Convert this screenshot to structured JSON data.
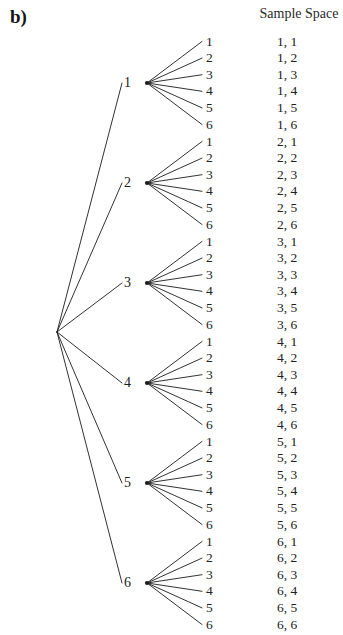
{
  "figure": {
    "panel_label": "b)",
    "column_header": "Sample Space"
  },
  "geometry": {
    "root_x": 57,
    "root_y": 332,
    "node_x": 147,
    "label_x": 131,
    "trunk_end_x": 122,
    "leaf_end_x": 202,
    "leaf_text_x": 206,
    "outcome_text_x": 277,
    "group_spacing": 100,
    "first_group_y": 83,
    "row_spacing": 16.6,
    "line_color": "#1b1b1b",
    "line_width": 0.9,
    "background": "#ffffff"
  },
  "tree": {
    "stages": [
      {
        "label": "1",
        "node_y": 83,
        "leaves": [
          {
            "label": "1",
            "outcome": "1, 1"
          },
          {
            "label": "2",
            "outcome": "1, 2"
          },
          {
            "label": "3",
            "outcome": "1, 3"
          },
          {
            "label": "4",
            "outcome": "1, 4"
          },
          {
            "label": "5",
            "outcome": "1, 5"
          },
          {
            "label": "6",
            "outcome": "1, 6"
          }
        ]
      },
      {
        "label": "2",
        "node_y": 183,
        "leaves": [
          {
            "label": "1",
            "outcome": "2, 1"
          },
          {
            "label": "2",
            "outcome": "2, 2"
          },
          {
            "label": "3",
            "outcome": "2, 3"
          },
          {
            "label": "4",
            "outcome": "2, 4"
          },
          {
            "label": "5",
            "outcome": "2, 5"
          },
          {
            "label": "6",
            "outcome": "2, 6"
          }
        ]
      },
      {
        "label": "3",
        "node_y": 283,
        "leaves": [
          {
            "label": "1",
            "outcome": "3, 1"
          },
          {
            "label": "2",
            "outcome": "3, 2"
          },
          {
            "label": "3",
            "outcome": "3, 3"
          },
          {
            "label": "4",
            "outcome": "3, 4"
          },
          {
            "label": "5",
            "outcome": "3, 5"
          },
          {
            "label": "6",
            "outcome": "3, 6"
          }
        ]
      },
      {
        "label": "4",
        "node_y": 383,
        "leaves": [
          {
            "label": "1",
            "outcome": "4, 1"
          },
          {
            "label": "2",
            "outcome": "4, 2"
          },
          {
            "label": "3",
            "outcome": "4, 3"
          },
          {
            "label": "4",
            "outcome": "4, 4"
          },
          {
            "label": "5",
            "outcome": "4, 5"
          },
          {
            "label": "6",
            "outcome": "4, 6"
          }
        ]
      },
      {
        "label": "5",
        "node_y": 483,
        "leaves": [
          {
            "label": "1",
            "outcome": "5, 1"
          },
          {
            "label": "2",
            "outcome": "5, 2"
          },
          {
            "label": "3",
            "outcome": "5, 3"
          },
          {
            "label": "4",
            "outcome": "5, 4"
          },
          {
            "label": "5",
            "outcome": "5, 5"
          },
          {
            "label": "6",
            "outcome": "5, 6"
          }
        ]
      },
      {
        "label": "6",
        "node_y": 583,
        "leaves": [
          {
            "label": "1",
            "outcome": "6, 1"
          },
          {
            "label": "2",
            "outcome": "6, 2"
          },
          {
            "label": "3",
            "outcome": "6, 3"
          },
          {
            "label": "4",
            "outcome": "6, 4"
          },
          {
            "label": "5",
            "outcome": "6, 5"
          },
          {
            "label": "6",
            "outcome": "6, 6"
          }
        ]
      }
    ]
  }
}
